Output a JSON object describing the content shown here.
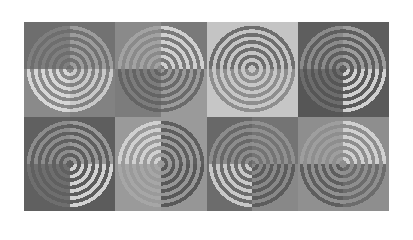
{
  "image": {
    "type": "truchet-style quarter-circle concentric ring pattern",
    "grid": {
      "columns": 8,
      "rows": 4
    },
    "ring_period_px": 7.2,
    "ring_stripe_fraction": 0.5,
    "rows": [
      [
        {
          "bg": "#6e6e6e",
          "ring": "#7e7e7e",
          "center": "bottom-right"
        },
        {
          "bg": "#727272",
          "ring": "#9c9c9c",
          "center": "bottom-left"
        },
        {
          "bg": "#8a8a8a",
          "ring": "#a2a2a2",
          "center": "bottom-right"
        },
        {
          "bg": "#7a7a7a",
          "ring": "#d0d0d0",
          "center": "bottom-left"
        },
        {
          "bg": "#c4c4c4",
          "ring": "#6e6e6e",
          "center": "bottom-right"
        },
        {
          "bg": "#c4c4c4",
          "ring": "#6e6e6e",
          "center": "bottom-left"
        },
        {
          "bg": "#5e5e5e",
          "ring": "#8a8a8a",
          "center": "bottom-right"
        },
        {
          "bg": "#5e5e5e",
          "ring": "#9c9c9c",
          "center": "bottom-left"
        }
      ],
      [
        {
          "bg": "#8a8a8a",
          "ring": "#d6d6d6",
          "center": "top-right"
        },
        {
          "bg": "#828282",
          "ring": "#c8c8c8",
          "center": "top-left"
        },
        {
          "bg": "#7c7c7c",
          "ring": "#646464",
          "center": "top-right"
        },
        {
          "bg": "#9a9a9a",
          "ring": "#6a6a6a",
          "center": "top-left"
        },
        {
          "bg": "#c6c6c6",
          "ring": "#8e8e8e",
          "center": "top-right"
        },
        {
          "bg": "#c6c6c6",
          "ring": "#8e8e8e",
          "center": "top-left"
        },
        {
          "bg": "#565656",
          "ring": "#6c6c6c",
          "center": "top-right"
        },
        {
          "bg": "#5a5a5a",
          "ring": "#d0d0d0",
          "center": "top-left"
        }
      ],
      [
        {
          "bg": "#606060",
          "ring": "#8c8c8c",
          "center": "bottom-right"
        },
        {
          "bg": "#5e5e5e",
          "ring": "#989898",
          "center": "bottom-left"
        },
        {
          "bg": "#9a9a9a",
          "ring": "#d0d0d0",
          "center": "bottom-right"
        },
        {
          "bg": "#9a9a9a",
          "ring": "#5e5e5e",
          "center": "bottom-left"
        },
        {
          "bg": "#686868",
          "ring": "#8c8c8c",
          "center": "bottom-right"
        },
        {
          "bg": "#747474",
          "ring": "#909090",
          "center": "bottom-left"
        },
        {
          "bg": "#8e8e8e",
          "ring": "#9e9e9e",
          "center": "bottom-right"
        },
        {
          "bg": "#8e8e8e",
          "ring": "#d0d0d0",
          "center": "bottom-left"
        }
      ],
      [
        {
          "bg": "#606060",
          "ring": "#6e6e6e",
          "center": "top-right"
        },
        {
          "bg": "#5c5c5c",
          "ring": "#d2d2d2",
          "center": "top-left"
        },
        {
          "bg": "#9a9a9a",
          "ring": "#a6a6a6",
          "center": "top-right"
        },
        {
          "bg": "#969696",
          "ring": "#585858",
          "center": "top-left"
        },
        {
          "bg": "#6c6c6c",
          "ring": "#c8c8c8",
          "center": "top-right"
        },
        {
          "bg": "#888888",
          "ring": "#5c5c5c",
          "center": "top-left"
        },
        {
          "bg": "#909090",
          "ring": "#5e5e5e",
          "center": "top-right"
        },
        {
          "bg": "#8e8e8e",
          "ring": "#6c6c6c",
          "center": "top-left"
        }
      ]
    ]
  }
}
